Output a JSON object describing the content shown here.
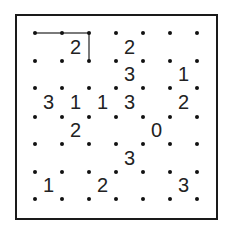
{
  "puzzle": {
    "type": "slitherlink",
    "rows": 6,
    "cols": 6,
    "clues": [
      [
        "",
        "2",
        "",
        "2",
        "",
        ""
      ],
      [
        "",
        "",
        "",
        "3",
        "",
        "1"
      ],
      [
        "3",
        "1",
        "1",
        "3",
        "",
        "2"
      ],
      [
        "",
        "2",
        "",
        "",
        "0",
        ""
      ],
      [
        "",
        "",
        "",
        "3",
        "",
        ""
      ],
      [
        "1",
        "",
        "2",
        "",
        "",
        "3"
      ]
    ],
    "drawn_edges": [
      {
        "from": [
          0,
          0
        ],
        "to": [
          0,
          1
        ]
      },
      {
        "from": [
          0,
          1
        ],
        "to": [
          0,
          2
        ]
      },
      {
        "from": [
          0,
          2
        ],
        "to": [
          1,
          2
        ]
      }
    ]
  },
  "colors": {
    "border": "#1a1a1a",
    "dot": "#111111",
    "edge": "#7a7a7a",
    "clue": "#222222"
  }
}
